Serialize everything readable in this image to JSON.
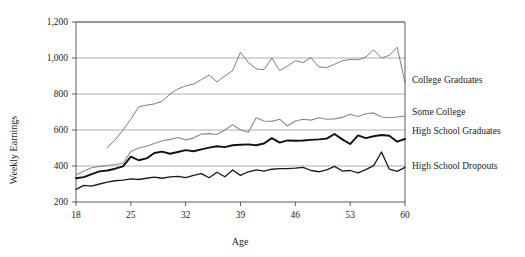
{
  "chart_data": {
    "type": "line",
    "title": "",
    "xlabel": "Age",
    "ylabel": "Weekly Earnings",
    "xlim": [
      18,
      60
    ],
    "ylim": [
      200,
      1200
    ],
    "xticks": [
      18,
      25,
      32,
      39,
      46,
      53,
      60
    ],
    "xticklabels": [
      "18",
      "25",
      "32",
      "39",
      "46",
      "53",
      "60"
    ],
    "yticks": [
      200,
      400,
      600,
      800,
      1000,
      1200
    ],
    "yticklabels": [
      "200",
      "400",
      "600",
      "800",
      "1,000",
      "1,200"
    ],
    "grid": "horizontal",
    "legend_position": "right-inline-labels",
    "series": [
      {
        "name": "College Graduates",
        "color": "#6e6e6e",
        "width": 0.9,
        "label_y": 880,
        "x": [
          22,
          23,
          24,
          25,
          26,
          27,
          28,
          29,
          30,
          31,
          32,
          33,
          34,
          35,
          36,
          37,
          38,
          39,
          40,
          41,
          42,
          43,
          44,
          45,
          46,
          47,
          48,
          49,
          50,
          51,
          52,
          53,
          54,
          55,
          56,
          57,
          58,
          59,
          60
        ],
        "values": [
          503,
          545,
          600,
          660,
          728,
          738,
          745,
          760,
          800,
          828,
          845,
          855,
          880,
          905,
          868,
          900,
          930,
          1032,
          975,
          940,
          935,
          1000,
          930,
          955,
          985,
          975,
          1002,
          950,
          947,
          965,
          985,
          992,
          990,
          1005,
          1045,
          1000,
          1015,
          1060,
          865
        ]
      },
      {
        "name": "Some College",
        "color": "#8a8a8a",
        "width": 1.1,
        "label_y": 700,
        "x": [
          18,
          19,
          20,
          21,
          22,
          23,
          24,
          25,
          26,
          27,
          28,
          29,
          30,
          31,
          32,
          33,
          34,
          35,
          36,
          37,
          38,
          39,
          40,
          41,
          42,
          43,
          44,
          45,
          46,
          47,
          48,
          49,
          50,
          51,
          52,
          53,
          54,
          55,
          56,
          57,
          58,
          59,
          60
        ],
        "values": [
          350,
          372,
          390,
          398,
          403,
          408,
          415,
          480,
          500,
          510,
          525,
          540,
          548,
          558,
          545,
          555,
          578,
          580,
          575,
          600,
          630,
          600,
          588,
          668,
          650,
          648,
          660,
          622,
          650,
          660,
          655,
          668,
          660,
          662,
          670,
          688,
          675,
          690,
          695,
          672,
          668,
          672,
          678
        ]
      },
      {
        "name": "High School Graduates",
        "color": "#111111",
        "width": 1.9,
        "label_y": 598,
        "x": [
          18,
          19,
          20,
          21,
          22,
          23,
          24,
          25,
          26,
          27,
          28,
          29,
          30,
          31,
          32,
          33,
          34,
          35,
          36,
          37,
          38,
          39,
          40,
          41,
          42,
          43,
          44,
          45,
          46,
          47,
          48,
          49,
          50,
          51,
          52,
          53,
          54,
          55,
          56,
          57,
          58,
          59,
          60
        ],
        "values": [
          332,
          338,
          355,
          370,
          375,
          385,
          398,
          452,
          432,
          442,
          472,
          480,
          468,
          478,
          488,
          482,
          492,
          502,
          510,
          505,
          515,
          518,
          520,
          515,
          525,
          555,
          530,
          542,
          540,
          542,
          545,
          548,
          552,
          578,
          548,
          522,
          570,
          555,
          565,
          572,
          568,
          535,
          550
        ]
      },
      {
        "name": "High School Dropouts",
        "color": "#1a1a1a",
        "width": 1.3,
        "label_y": 405,
        "x": [
          18,
          19,
          20,
          21,
          22,
          23,
          24,
          25,
          26,
          27,
          28,
          29,
          30,
          31,
          32,
          33,
          34,
          35,
          36,
          37,
          38,
          39,
          40,
          41,
          42,
          43,
          44,
          45,
          46,
          47,
          48,
          49,
          50,
          51,
          52,
          53,
          54,
          55,
          56,
          57,
          58,
          59,
          60
        ],
        "values": [
          270,
          292,
          288,
          300,
          310,
          318,
          322,
          328,
          325,
          332,
          338,
          332,
          340,
          342,
          335,
          348,
          358,
          335,
          365,
          340,
          378,
          348,
          368,
          378,
          372,
          382,
          385,
          385,
          388,
          392,
          375,
          368,
          378,
          398,
          372,
          375,
          362,
          380,
          402,
          478,
          382,
          370,
          392
        ]
      }
    ]
  },
  "labels": {
    "series_labels": [
      "College Graduates",
      "Some College",
      "High School Graduates",
      "High School Dropouts"
    ]
  }
}
